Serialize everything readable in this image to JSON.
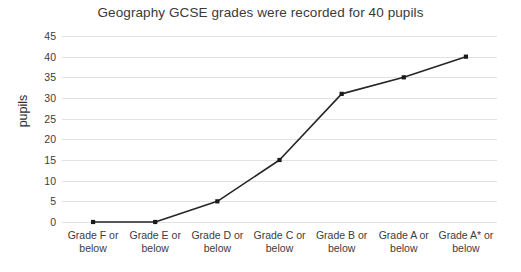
{
  "chart_data": {
    "type": "line",
    "title": "Geography GCSE grades were recorded for 40 pupils",
    "xlabel": "",
    "ylabel": "pupils",
    "categories": [
      "Grade F or below",
      "Grade E or below",
      "Grade D or below",
      "Grade C or below",
      "Grade B or below",
      "Grade A or below",
      "Grade A* or below"
    ],
    "category_lines": [
      [
        "Grade F or",
        "below"
      ],
      [
        "Grade E or",
        "below"
      ],
      [
        "Grade D or",
        "below"
      ],
      [
        "Grade C or",
        "below"
      ],
      [
        "Grade B or",
        "below"
      ],
      [
        "Grade A or",
        "below"
      ],
      [
        "Grade A* or",
        "below"
      ]
    ],
    "values": [
      0,
      0,
      5,
      15,
      31,
      35,
      40
    ],
    "ylim": [
      0,
      45
    ],
    "yticks": [
      0,
      5,
      10,
      15,
      20,
      25,
      30,
      35,
      40,
      45
    ],
    "ytick_labels": [
      "0",
      "5",
      "10",
      "15",
      "20",
      "25",
      "30",
      "35",
      "40",
      "45"
    ],
    "grid": true,
    "legend": false,
    "line_color": "#262626",
    "marker_color": "#1a1a1a",
    "grid_color": "#e2e2e2",
    "background_color": "#ffffff",
    "text_color": "#3c3c3c"
  }
}
